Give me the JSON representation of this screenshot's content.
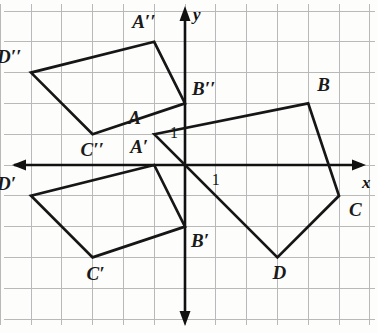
{
  "figure": {
    "axes": {
      "x_label": "x",
      "y_label": "y",
      "x_tick_label": "1",
      "y_tick_label": "1",
      "axis_color": "#111111",
      "grid_color": "#b9b9b9",
      "shape_color": "#161616"
    },
    "grid": {
      "origin_px": [
        185,
        165
      ],
      "cell_px": 30.8,
      "x_range": [
        -6,
        6
      ],
      "y_range": [
        -5,
        5
      ],
      "grid_on": true
    },
    "shapes": [
      {
        "name": "ABCD",
        "vertices": [
          {
            "label": "A",
            "x": -1,
            "y": 1,
            "label_dx": -26,
            "label_dy": -26
          },
          {
            "label": "B",
            "x": 4,
            "y": 2,
            "label_dx": 9,
            "label_dy": -28
          },
          {
            "label": "C",
            "x": 5,
            "y": -1,
            "label_dx": 10,
            "label_dy": 4
          },
          {
            "label": "D",
            "x": 3,
            "y": -3,
            "label_dx": -5,
            "label_dy": 6
          }
        ]
      },
      {
        "name": "A'B'C'D'",
        "vertices": [
          {
            "label": "A′",
            "x": -1,
            "y": 0,
            "label_dx": -24,
            "label_dy": -28
          },
          {
            "label": "B′",
            "x": 0,
            "y": -2,
            "label_dx": 6,
            "label_dy": 4
          },
          {
            "label": "C′",
            "x": -3,
            "y": -3,
            "label_dx": -6,
            "label_dy": 7
          },
          {
            "label": "D′",
            "x": -5,
            "y": -1,
            "label_dx": -34,
            "label_dy": -22
          }
        ]
      },
      {
        "name": "A''B''C''D''",
        "vertices": [
          {
            "label": "A′′",
            "x": -1,
            "y": 4,
            "label_dx": -22,
            "label_dy": -30
          },
          {
            "label": "B′′",
            "x": 0,
            "y": 2,
            "label_dx": 7,
            "label_dy": -24
          },
          {
            "label": "C′′",
            "x": -3,
            "y": 1,
            "label_dx": -12,
            "label_dy": 6
          },
          {
            "label": "D′′",
            "x": -5,
            "y": 3,
            "label_dx": -34,
            "label_dy": -26
          }
        ]
      }
    ]
  }
}
